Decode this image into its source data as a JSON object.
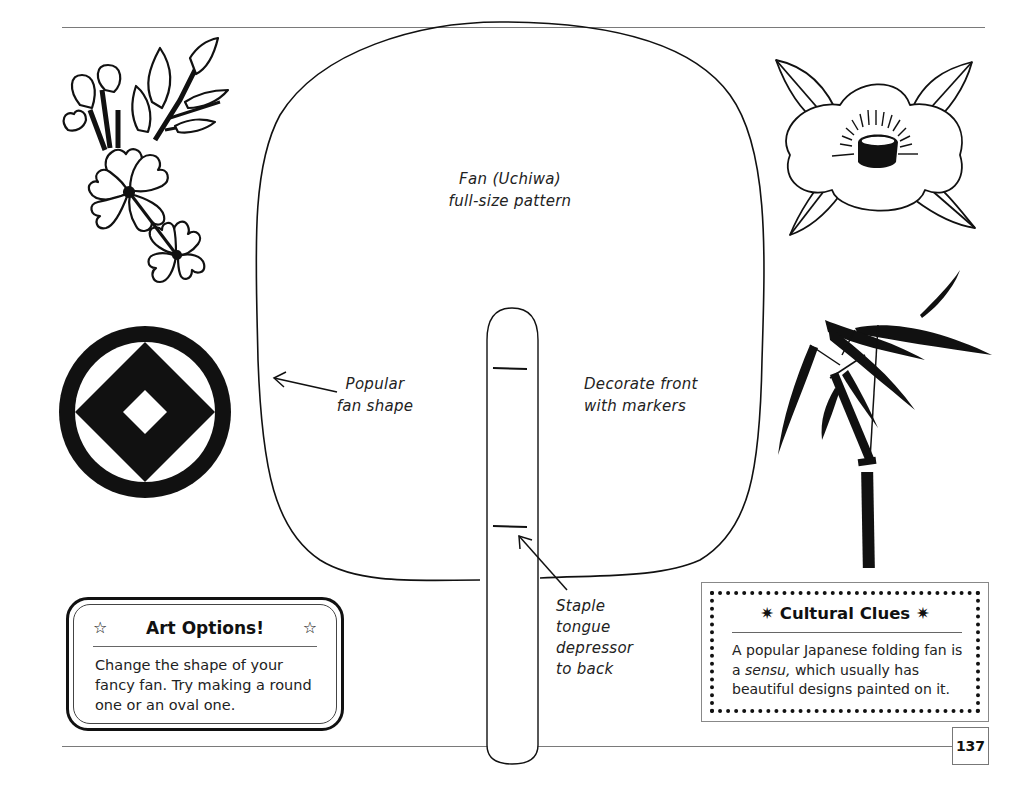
{
  "page": {
    "page_number": "137"
  },
  "pattern": {
    "title_line1": "Fan (Uchiwa)",
    "title_line2": "full-size pattern",
    "shape_label_line1": "Popular",
    "shape_label_line2": "fan shape",
    "decorate_label_line1": "Decorate front",
    "decorate_label_line2": "with markers",
    "staple_label_lines": [
      "Staple",
      "tongue",
      "depressor",
      "to back"
    ]
  },
  "art_options": {
    "star_icon": "☆",
    "title": "Art Options!",
    "body": "Change the shape of your fancy fan. Try making a round one or an oval one."
  },
  "cultural_clues": {
    "asterisk_icon": "✷",
    "title": "Cultural Clues",
    "body_before": "A popular Japanese folding fan is a ",
    "body_emphasis": "sensu,",
    "body_after": " which usually has beautiful designs painted on it."
  },
  "illustrations": {
    "top_left": "cherry-blossom-branch",
    "top_right": "camellia-flower",
    "middle_left": "diamond-crest",
    "middle_right": "bamboo-stalk"
  }
}
